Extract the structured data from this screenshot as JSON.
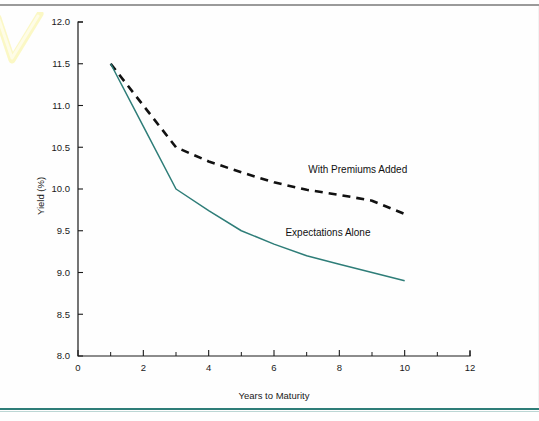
{
  "page": {
    "background_color": "#fefefe",
    "top_rule_color": "#9a9a9a",
    "bottom_rule_color": "#2e7d78",
    "highlighter_mark": "yellow-check-mark"
  },
  "chart_data": {
    "type": "line",
    "title": "",
    "subtitle": "",
    "xlabel": "Years to Maturity",
    "ylabel": "Yield (%)",
    "xlim": [
      0,
      12
    ],
    "ylim": [
      8.0,
      12.0
    ],
    "grid": false,
    "legend_position": "inline-annotation",
    "x_ticks": [
      0,
      2,
      4,
      6,
      8,
      10,
      12
    ],
    "x_tick_labels": [
      "0",
      "2",
      "4",
      "6",
      "8",
      "10",
      "12"
    ],
    "x_minor_ticks": [
      1,
      3,
      5,
      7,
      9,
      11
    ],
    "y_ticks": [
      8.0,
      8.5,
      9.0,
      9.5,
      10.0,
      10.5,
      11.0,
      11.5,
      12.0
    ],
    "y_tick_labels": [
      "8.0",
      "8.5",
      "9.0",
      "9.5",
      "10.0",
      "10.5",
      "11.0",
      "11.5",
      "12.0"
    ],
    "series": [
      {
        "name": "With Premiums  Added",
        "style": "dashed",
        "color": "#111111",
        "x": [
          1,
          2,
          3,
          4,
          5,
          6,
          7,
          8,
          9,
          10
        ],
        "values": [
          11.5,
          11.0,
          10.5,
          10.33,
          10.2,
          10.08,
          9.99,
          9.93,
          9.86,
          9.7
        ],
        "label_x": 7.05,
        "label_y": 10.19
      },
      {
        "name": "Expectations Alone",
        "style": "solid",
        "color": "#2e7d78",
        "x": [
          1,
          2,
          3,
          4,
          5,
          6,
          7,
          8,
          9,
          10
        ],
        "values": [
          11.5,
          10.75,
          10.0,
          9.74,
          9.5,
          9.34,
          9.2,
          9.1,
          9.0,
          8.9
        ],
        "label_x": 6.35,
        "label_y": 9.44
      }
    ]
  }
}
